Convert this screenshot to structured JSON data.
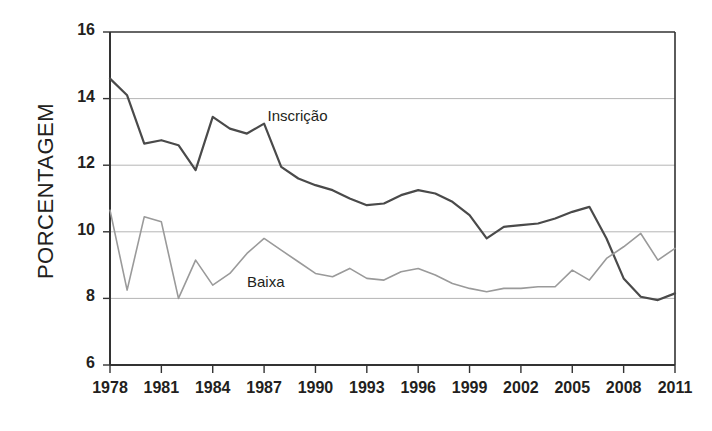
{
  "chart_data": {
    "type": "line",
    "title": "",
    "xlabel": "",
    "ylabel": "PORCENTAGEM",
    "xlim": [
      1978,
      2011
    ],
    "ylim": [
      6,
      16
    ],
    "ytick_labels": [
      "16",
      "14",
      "12",
      "10",
      "8",
      "6"
    ],
    "ytick_values": [
      16,
      14,
      12,
      10,
      8,
      6
    ],
    "xtick_labels": [
      "1978",
      "1981",
      "1984",
      "1987",
      "1990",
      "1993",
      "1996",
      "1999",
      "2002",
      "2005",
      "2008",
      "2011"
    ],
    "xtick_values": [
      1978,
      1981,
      1984,
      1987,
      1990,
      1993,
      1996,
      1999,
      2002,
      2005,
      2008,
      2011
    ],
    "grid": "horizontal",
    "gridlines_at": [
      14,
      12,
      10,
      8
    ],
    "legend_position": "inline-annotation",
    "x": [
      1978,
      1979,
      1980,
      1981,
      1982,
      1983,
      1984,
      1985,
      1986,
      1987,
      1988,
      1989,
      1990,
      1991,
      1992,
      1993,
      1994,
      1995,
      1996,
      1997,
      1998,
      1999,
      2000,
      2001,
      2002,
      2003,
      2004,
      2005,
      2006,
      2007,
      2008,
      2009,
      2010,
      2011
    ],
    "series": [
      {
        "name": "Inscrição",
        "color": "#4a4a4a",
        "width": 2.2,
        "label_x": 1987.2,
        "label_y": 13.45,
        "values": [
          14.6,
          14.1,
          12.65,
          12.75,
          12.6,
          11.85,
          13.45,
          13.1,
          12.95,
          13.25,
          11.95,
          11.6,
          11.4,
          11.25,
          11.0,
          10.8,
          10.85,
          11.1,
          11.25,
          11.15,
          10.9,
          10.5,
          9.8,
          10.15,
          10.2,
          10.25,
          10.4,
          10.6,
          10.75,
          9.8,
          8.6,
          8.05,
          7.95,
          8.15
        ]
      },
      {
        "name": "Baixa",
        "color": "#9a9a9a",
        "width": 1.6,
        "label_x": 1986.0,
        "label_y": 8.45,
        "values": [
          10.65,
          8.25,
          10.45,
          10.3,
          8.0,
          9.15,
          8.4,
          8.75,
          9.35,
          9.8,
          9.45,
          9.1,
          8.75,
          8.65,
          8.9,
          8.6,
          8.55,
          8.8,
          8.9,
          8.7,
          8.45,
          8.3,
          8.2,
          8.3,
          8.3,
          8.35,
          8.35,
          8.85,
          8.55,
          9.2,
          9.55,
          9.95,
          9.15,
          9.5
        ]
      }
    ]
  },
  "axis_style": {
    "axis_color": "#333333",
    "grid_color": "#b5b5b5",
    "text_color": "#231f20"
  }
}
